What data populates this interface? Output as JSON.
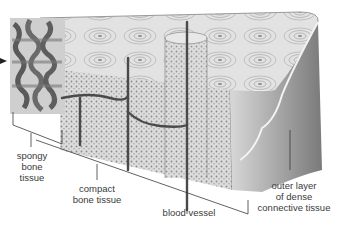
{
  "diagram": {
    "colors": {
      "background": "#ffffff",
      "tissue_light": "#e4e4e4",
      "tissue_mid": "#bdbdbd",
      "tissue_dark": "#6e6e6e",
      "vessel": "#4a4a4a",
      "leader_line": "#3a3a3a",
      "label_text": "#3a3a3a"
    },
    "labels": [
      {
        "id": "spongy",
        "lines": [
          "spongy",
          "bone",
          "tissue"
        ]
      },
      {
        "id": "compact",
        "lines": [
          "compact",
          "bone tissue"
        ]
      },
      {
        "id": "vessel",
        "lines": [
          "blood vessel"
        ]
      },
      {
        "id": "outer",
        "lines": [
          "outer layer",
          "of dense",
          "connective tissue"
        ]
      }
    ],
    "pointer_arrow": "arrow-right-icon"
  }
}
